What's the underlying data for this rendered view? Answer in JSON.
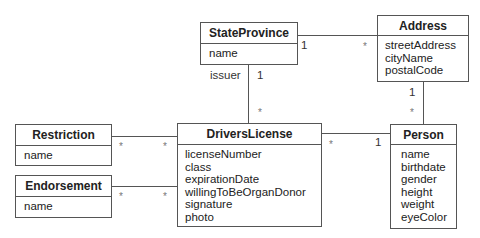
{
  "diagram": {
    "type": "UML class diagram",
    "classes": {
      "state_province": {
        "name": "StateProvince",
        "attributes": [
          "name"
        ]
      },
      "address": {
        "name": "Address",
        "attributes": [
          "streetAddress",
          "cityName",
          "postalCode"
        ]
      },
      "restriction": {
        "name": "Restriction",
        "attributes": [
          "name"
        ]
      },
      "endorsement": {
        "name": "Endorsement",
        "attributes": [
          "name"
        ]
      },
      "drivers_license": {
        "name": "DriversLicense",
        "attributes": [
          "licenseNumber",
          "class",
          "expirationDate",
          "willingToBeOrganDonor",
          "signature",
          "photo"
        ]
      },
      "person": {
        "name": "Person",
        "attributes": [
          "name",
          "birthdate",
          "gender",
          "height",
          "weight",
          "eyeColor"
        ]
      }
    },
    "associations": {
      "stateprovince_address": {
        "from": "StateProvince",
        "to": "Address",
        "from_mult": "1",
        "to_mult": "*"
      },
      "stateprovince_license": {
        "from": "StateProvince",
        "to": "DriversLicense",
        "role": "issuer",
        "from_mult": "1",
        "to_mult": "*"
      },
      "address_person": {
        "from": "Address",
        "to": "Person",
        "from_mult": "1",
        "to_mult": "*"
      },
      "restriction_license": {
        "from": "Restriction",
        "to": "DriversLicense",
        "from_mult": "*",
        "to_mult": "*"
      },
      "endorsement_license": {
        "from": "Endorsement",
        "to": "DriversLicense",
        "from_mult": "*",
        "to_mult": "*"
      },
      "license_person": {
        "from": "DriversLicense",
        "to": "Person",
        "from_mult": "*",
        "to_mult": "1"
      }
    }
  }
}
